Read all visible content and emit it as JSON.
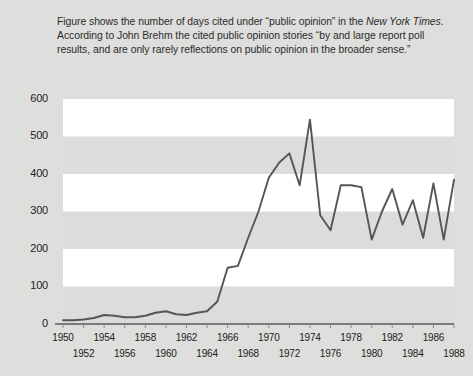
{
  "figure": {
    "background_color": "#dededc",
    "plot_band_light": "#ffffff",
    "plot_band_dark": "#dcdcda",
    "line_color": "#555555",
    "text_color": "#2b2b2b"
  },
  "caption": {
    "part1": "Figure shows the number of days cited under “public opinion” in the ",
    "emphasis": "New York Times",
    "part2": ". According to John Brehm the cited public opinion stories “by and large report poll results, and are only rarely reflections on public opinion in the broader sense.”"
  },
  "chart_data": {
    "type": "line",
    "title": "",
    "xlabel": "",
    "ylabel": "",
    "xlim": [
      1950,
      1988
    ],
    "ylim": [
      0,
      600
    ],
    "grid": "horizontal-bands",
    "legend": "none",
    "y_ticks": [
      0,
      100,
      200,
      300,
      400,
      500,
      600
    ],
    "x_ticks": [
      1950,
      1952,
      1954,
      1956,
      1958,
      1960,
      1962,
      1964,
      1966,
      1968,
      1970,
      1972,
      1974,
      1976,
      1978,
      1980,
      1982,
      1984,
      1986,
      1988
    ],
    "x_tick_rows": {
      "top": [
        1950,
        1954,
        1958,
        1962,
        1966,
        1970,
        1974,
        1978,
        1982,
        1986
      ],
      "bottom": [
        1952,
        1956,
        1960,
        1964,
        1968,
        1972,
        1976,
        1980,
        1984,
        1988
      ]
    },
    "x": [
      1950,
      1951,
      1952,
      1953,
      1954,
      1955,
      1956,
      1957,
      1958,
      1959,
      1960,
      1961,
      1962,
      1963,
      1964,
      1965,
      1966,
      1967,
      1968,
      1969,
      1970,
      1971,
      1972,
      1973,
      1974,
      1975,
      1976,
      1977,
      1978,
      1979,
      1980,
      1981,
      1982,
      1983,
      1984,
      1985,
      1986,
      1987,
      1988
    ],
    "values": [
      10,
      10,
      12,
      16,
      24,
      22,
      18,
      18,
      22,
      30,
      34,
      26,
      24,
      30,
      34,
      60,
      150,
      155,
      230,
      300,
      390,
      430,
      455,
      370,
      545,
      290,
      250,
      370,
      370,
      365,
      225,
      300,
      360,
      265,
      330,
      230,
      375,
      225,
      385
    ],
    "series": [
      {
        "name": "days cited under “public opinion” in the New York Times",
        "values": [
          10,
          10,
          12,
          16,
          24,
          22,
          18,
          18,
          22,
          30,
          34,
          26,
          24,
          30,
          34,
          60,
          150,
          155,
          230,
          300,
          390,
          430,
          455,
          370,
          545,
          290,
          250,
          370,
          370,
          365,
          225,
          300,
          360,
          265,
          330,
          230,
          375,
          225,
          385
        ]
      }
    ]
  }
}
